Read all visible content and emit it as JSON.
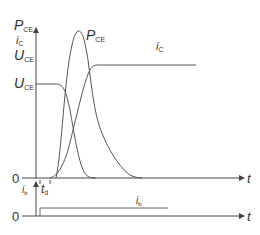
{
  "diagram": {
    "y_axis_labels": {
      "top_line1": "P",
      "top_line1_sub": "CE",
      "top_line2": "i",
      "top_line2_sub": "C",
      "top_line3": "U",
      "top_line3_sub": "CE"
    },
    "level_label": "U",
    "level_label_sub": "CE",
    "curve_labels": {
      "pce": "P",
      "pce_sub": "CE",
      "ic": "i",
      "ic_sub": "C",
      "ib": "i",
      "ib_sub": "b"
    },
    "lower_axis_label": "i",
    "lower_axis_label_sub": "b",
    "delay_label": "t",
    "delay_label_sub": "d",
    "origin_upper": "0",
    "origin_lower": "0",
    "time_label_upper": "t",
    "time_label_lower": "t",
    "colors": {
      "line": "#555555",
      "axis": "#444444",
      "text": "#333333"
    }
  }
}
